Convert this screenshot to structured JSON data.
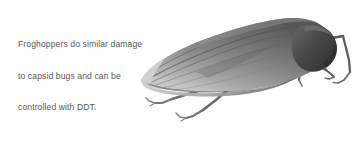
{
  "figure": {
    "background_color": "#ffffff",
    "width": 358,
    "height": 141
  },
  "caption": {
    "text_color": "#58585a",
    "line1": "Froghoppers do similar damage",
    "line2": "to capsid bugs and can be",
    "line3": "controlled with DDT.",
    "full_text": "Froghoppers do similar damage to capsid bugs and can be controlled with DDT."
  },
  "illustration": {
    "subject": "froghopper",
    "style": "grayscale photograph",
    "orientation": "head at right, abdomen tapering to left",
    "body_color_dark": "#4a4a4a",
    "body_color_mid": "#8d8d8d",
    "body_color_light": "#c9c9c9",
    "head_color": "#3f3f3f",
    "leg_color": "#6e6e6e",
    "leg_count_visible": 4
  }
}
